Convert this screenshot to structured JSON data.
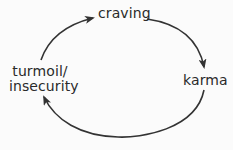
{
  "diagram": {
    "type": "cycle",
    "nodes": [
      {
        "id": "craving",
        "label": "craving"
      },
      {
        "id": "karma",
        "label": "karma"
      },
      {
        "id": "turmoil",
        "label_line1": "turmoil/",
        "label_line2": "insecurity"
      }
    ],
    "edges": [
      {
        "from": "craving",
        "to": "karma"
      },
      {
        "from": "karma",
        "to": "turmoil"
      },
      {
        "from": "turmoil",
        "to": "craving"
      }
    ],
    "colors": {
      "stroke": "#333333",
      "text": "#2a2a2a",
      "background": "#fbfbfb"
    }
  }
}
